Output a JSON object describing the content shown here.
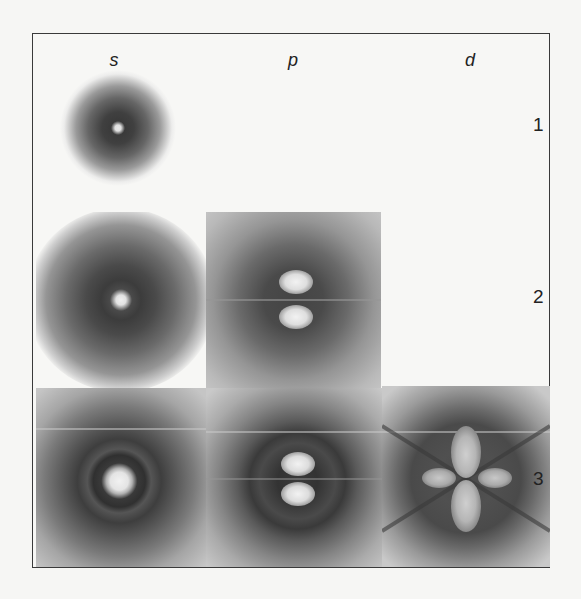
{
  "figure": {
    "columns": [
      {
        "id": "s",
        "label": "s"
      },
      {
        "id": "p",
        "label": "p"
      },
      {
        "id": "d",
        "label": "d"
      }
    ],
    "rows": [
      {
        "id": "1",
        "label": "1"
      },
      {
        "id": "2",
        "label": "2"
      },
      {
        "id": "3",
        "label": "3"
      }
    ],
    "panels": [
      {
        "orbital": "1s",
        "row": "1",
        "col": "s"
      },
      {
        "orbital": "2s",
        "row": "2",
        "col": "s"
      },
      {
        "orbital": "2p",
        "row": "2",
        "col": "p"
      },
      {
        "orbital": "3s",
        "row": "3",
        "col": "s"
      },
      {
        "orbital": "3p",
        "row": "3",
        "col": "p"
      },
      {
        "orbital": "3d",
        "row": "3",
        "col": "d"
      }
    ],
    "colors": {
      "background": "#f6f6f4",
      "border": "#3a3a3a",
      "density_dark": "#3c3c3c",
      "density_light": "#e8e8e8"
    }
  }
}
